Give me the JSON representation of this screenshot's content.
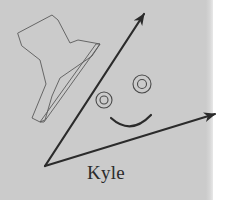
{
  "canvas": {
    "width": 235,
    "height": 200,
    "background_color": "#ffffff",
    "panel_color": "#cbcbcb",
    "panel_right_edge_x": 212,
    "ink_color": "#2b2b2b",
    "thin_ink_color": "#555555"
  },
  "caption": {
    "text": "Kyle"
  },
  "figure": {
    "shared_vertex": {
      "x": 45,
      "y": 166
    },
    "arrows": [
      {
        "name": "arrow-up-right",
        "from": {
          "x": 45,
          "y": 166
        },
        "to": {
          "x": 148,
          "y": 8
        },
        "arrowhead": "up-right",
        "stroke_width": 2.2
      },
      {
        "name": "arrow-right",
        "from": {
          "x": 45,
          "y": 166
        },
        "to": {
          "x": 222,
          "y": 112
        },
        "arrowhead": "right",
        "stroke_width": 2.0
      }
    ],
    "face": {
      "left_eye": {
        "cx": 104,
        "cy": 100,
        "r_outer": 8,
        "r_inner": 4
      },
      "right_eye": {
        "cx": 142,
        "cy": 84,
        "r_outer": 9,
        "r_inner": 4.5
      },
      "smile": {
        "from_x": 111,
        "from_y": 119,
        "to_x": 151,
        "to_y": 116,
        "depth": 12
      }
    },
    "polygon": {
      "name": "flag-polygon",
      "points": "18,33 52,15 58,20 70,43 78,40 100,44 92,56 60,78 52,96 45,120 40,122 32,118 46,84 40,60 22,46",
      "stroke_width": 0.9
    },
    "sliver": {
      "name": "sliver-tail",
      "points": "100,44 44,122 40,122 96,44",
      "stroke_width": 0.9
    }
  }
}
